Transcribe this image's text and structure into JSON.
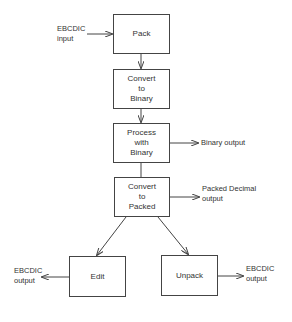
{
  "diagram": {
    "type": "flowchart",
    "nodes": {
      "pack": {
        "lines": [
          "Pack"
        ]
      },
      "convert_binary": {
        "lines": [
          "Convert",
          "to",
          "Binary"
        ]
      },
      "process_binary": {
        "lines": [
          "Process",
          "with",
          "Binary"
        ]
      },
      "convert_packed": {
        "lines": [
          "Convert",
          "to",
          "Packed"
        ]
      },
      "edit": {
        "lines": [
          "Edit"
        ]
      },
      "unpack": {
        "lines": [
          "Unpack"
        ]
      }
    },
    "labels": {
      "ebcdic_input": [
        "EBCDIC",
        "input"
      ],
      "binary_output": [
        "Binary output"
      ],
      "packed_output": [
        "Packed Decimal",
        "output"
      ],
      "edit_output": [
        "EBCDIC",
        "output"
      ],
      "unpack_output": [
        "EBCDIC",
        "output"
      ]
    },
    "edges": [
      {
        "from": "EBCDIC input",
        "to": "Pack"
      },
      {
        "from": "Pack",
        "to": "Convert to Binary"
      },
      {
        "from": "Convert to Binary",
        "to": "Process with Binary"
      },
      {
        "from": "Process with Binary",
        "to": "Binary output"
      },
      {
        "from": "Process with Binary",
        "to": "Convert to Packed"
      },
      {
        "from": "Convert to Packed",
        "to": "Packed Decimal output"
      },
      {
        "from": "Convert to Packed",
        "to": "Edit"
      },
      {
        "from": "Convert to Packed",
        "to": "Unpack"
      },
      {
        "from": "Edit",
        "to": "EBCDIC output"
      },
      {
        "from": "Unpack",
        "to": "EBCDIC output"
      }
    ],
    "colors": {
      "stroke": "#444444",
      "text": "#333333",
      "background": "#ffffff"
    }
  }
}
